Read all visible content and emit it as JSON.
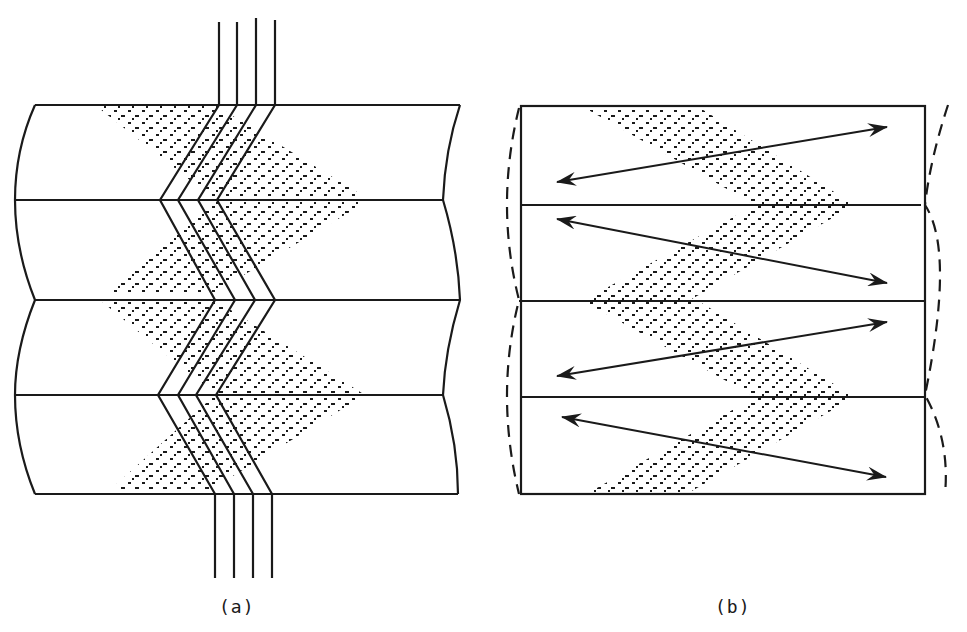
{
  "figure": {
    "panels": [
      {
        "id": "a",
        "label": "(a)",
        "description": "Four stacked layers with curved left/right boundaries; four parallel lines pass vertically through a zigzag (chevron) band, with dotted diamond-shaped scattering zones"
      },
      {
        "id": "b",
        "label": "(b)",
        "description": "Four stacked rectangular layers with zigzag double-headed arrows across each layer, dotted diamond zones, and dashed curved outlines at left and right edges"
      }
    ],
    "colors": {
      "ink": "#1a1a1a",
      "background": "#ffffff"
    }
  }
}
